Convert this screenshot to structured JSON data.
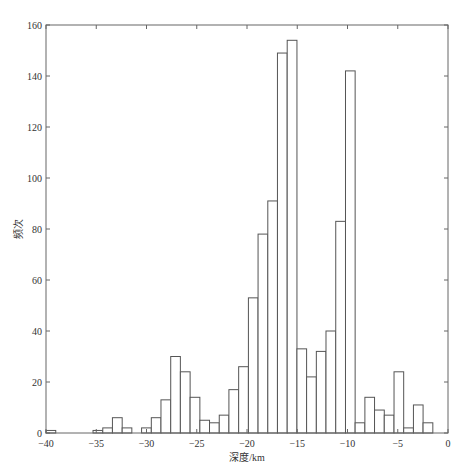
{
  "chart_data": {
    "type": "bar",
    "subtype": "histogram",
    "title": "",
    "xlabel": "深度/km",
    "ylabel": "频次",
    "xlim": [
      -40,
      0
    ],
    "ylim": [
      0,
      160
    ],
    "grid": false,
    "legend": null,
    "xticks": [
      -40,
      -35,
      -30,
      -25,
      -20,
      -15,
      -10,
      -5,
      0
    ],
    "xtick_labels": [
      "-40",
      "-35",
      "-30",
      "-25",
      "-20",
      "-15",
      "-10",
      "-5",
      "0"
    ],
    "yticks": [
      0,
      20,
      40,
      60,
      80,
      100,
      120,
      140,
      160
    ],
    "ytick_labels": [
      "0",
      "20",
      "40",
      "60",
      "80",
      "100",
      "120",
      "140",
      "160"
    ],
    "bin_width": 0.966,
    "bins": [
      {
        "left": -40.0,
        "right": -39.03,
        "count": 1
      },
      {
        "left": -35.32,
        "right": -34.35,
        "count": 1
      },
      {
        "left": -34.35,
        "right": -33.39,
        "count": 2
      },
      {
        "left": -33.39,
        "right": -32.42,
        "count": 6
      },
      {
        "left": -32.42,
        "right": -31.46,
        "count": 2
      },
      {
        "left": -31.46,
        "right": -30.49,
        "count": 0
      },
      {
        "left": -30.49,
        "right": -29.52,
        "count": 2
      },
      {
        "left": -29.52,
        "right": -28.56,
        "count": 6
      },
      {
        "left": -28.56,
        "right": -27.59,
        "count": 13
      },
      {
        "left": -27.59,
        "right": -26.63,
        "count": 30
      },
      {
        "left": -26.63,
        "right": -25.66,
        "count": 24
      },
      {
        "left": -25.66,
        "right": -24.69,
        "count": 14
      },
      {
        "left": -24.69,
        "right": -23.73,
        "count": 5
      },
      {
        "left": -23.73,
        "right": -22.76,
        "count": 4
      },
      {
        "left": -22.76,
        "right": -21.8,
        "count": 7
      },
      {
        "left": -21.8,
        "right": -20.83,
        "count": 17
      },
      {
        "left": -20.83,
        "right": -19.86,
        "count": 26
      },
      {
        "left": -19.86,
        "right": -18.9,
        "count": 53
      },
      {
        "left": -18.9,
        "right": -17.93,
        "count": 78
      },
      {
        "left": -17.93,
        "right": -16.97,
        "count": 91
      },
      {
        "left": -16.97,
        "right": -16.0,
        "count": 149
      },
      {
        "left": -16.0,
        "right": -15.03,
        "count": 154
      },
      {
        "left": -15.03,
        "right": -14.07,
        "count": 33
      },
      {
        "left": -14.07,
        "right": -13.1,
        "count": 22
      },
      {
        "left": -13.1,
        "right": -12.14,
        "count": 32
      },
      {
        "left": -12.14,
        "right": -11.17,
        "count": 40
      },
      {
        "left": -11.17,
        "right": -10.2,
        "count": 83
      },
      {
        "left": -10.2,
        "right": -9.24,
        "count": 142
      },
      {
        "left": -9.24,
        "right": -8.27,
        "count": 4
      },
      {
        "left": -8.27,
        "right": -7.31,
        "count": 14
      },
      {
        "left": -7.31,
        "right": -6.34,
        "count": 9
      },
      {
        "left": -6.34,
        "right": -5.37,
        "count": 7
      },
      {
        "left": -5.37,
        "right": -4.41,
        "count": 24
      },
      {
        "left": -4.41,
        "right": -3.44,
        "count": 2
      },
      {
        "left": -3.44,
        "right": -2.48,
        "count": 11
      },
      {
        "left": -2.48,
        "right": -1.51,
        "count": 4
      }
    ]
  },
  "style": {
    "bar_fill": "#ffffff",
    "bar_stroke": "#555555",
    "axis_color": "#666666",
    "text_color": "#333333",
    "background": "#ffffff"
  }
}
